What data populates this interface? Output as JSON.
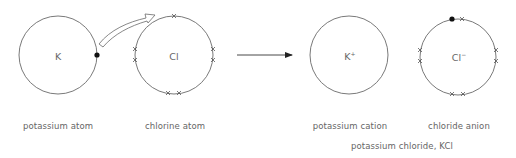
{
  "diagram": {
    "colors": {
      "line": "#6a6a6a",
      "text": "#666666",
      "electron_dot": "#111111",
      "background": "#ffffff"
    },
    "reactants": [
      {
        "id": "potassium-atom",
        "symbol": "K",
        "charge": "",
        "label": "potassium atom",
        "outer_electrons": {
          "dots": 1,
          "crosses": 0
        }
      },
      {
        "id": "chlorine-atom",
        "symbol": "Cl",
        "charge": "",
        "label": "chlorine atom",
        "outer_electrons": {
          "dots": 0,
          "crosses": 7
        }
      }
    ],
    "transfer_arrow": {
      "from": "potassium-atom",
      "to": "chlorine-atom",
      "meaning": "electron transfer"
    },
    "reaction_arrow": {
      "direction": "right"
    },
    "products": [
      {
        "id": "potassium-cation",
        "symbol": "K",
        "charge": "+",
        "label": "potassium cation",
        "outer_electrons": {
          "dots": 0,
          "crosses": 0
        }
      },
      {
        "id": "chloride-anion",
        "symbol": "Cl",
        "charge": "−",
        "label": "chloride anion",
        "outer_electrons": {
          "dots": 1,
          "crosses": 7
        }
      }
    ],
    "product_caption": "potassium chloride, KCl"
  }
}
